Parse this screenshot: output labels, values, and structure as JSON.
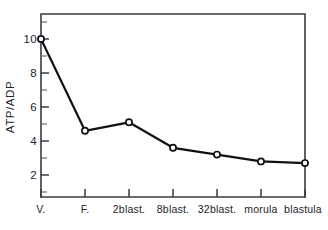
{
  "chart_data": {
    "type": "line",
    "title": "",
    "subtitle": "",
    "xlabel": "",
    "ylabel": "ATP/ADP",
    "categories": [
      "V.",
      "F.",
      "2blast.",
      "8blast.",
      "32blast.",
      "morula",
      "blastula"
    ],
    "values": [
      10.0,
      4.6,
      5.1,
      3.6,
      3.2,
      2.8,
      2.7
    ],
    "series": [
      {
        "name": "ATP/ADP",
        "values": [
          10.0,
          4.6,
          5.1,
          3.6,
          3.2,
          2.8,
          2.7
        ]
      }
    ],
    "ylim": [
      0,
      11.3
    ],
    "xlim": [
      0,
      7
    ],
    "y_major_ticks": [
      2,
      4,
      6,
      8,
      10
    ],
    "y_major_tick_labels": [
      "2",
      "4",
      "6",
      "8",
      "10"
    ],
    "y_minor_ticks": [
      1,
      3,
      5,
      7,
      9,
      11
    ],
    "grid": false,
    "legend": null,
    "legend_position": "none",
    "marker": "open-circle",
    "line_color": "#111115",
    "marker_face_color": "#ffffff",
    "axis_color": "#3a3a42",
    "background_color": "#ffffff",
    "annotations": []
  },
  "figure": {
    "name": "atp-adp-developmental-stage-line-chart"
  }
}
